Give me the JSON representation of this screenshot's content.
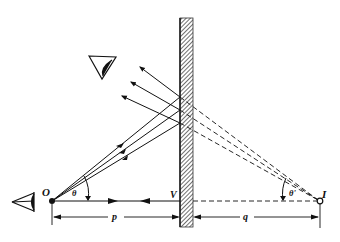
{
  "diagram": {
    "labels": {
      "object": "O",
      "image": "I",
      "vertex": "V",
      "object_distance": "p",
      "image_distance": "q",
      "angle_object": "θ",
      "angle_image": "θ'"
    },
    "elements": {
      "mirror": "plane mirror (hatched)",
      "eye_observer": "eye viewing reflected rays",
      "eye_object": "eye at object side",
      "rays": 3,
      "virtual_rays": "dashed extensions to image I"
    },
    "colors": {
      "line": "#111111",
      "background": "#ffffff"
    }
  }
}
